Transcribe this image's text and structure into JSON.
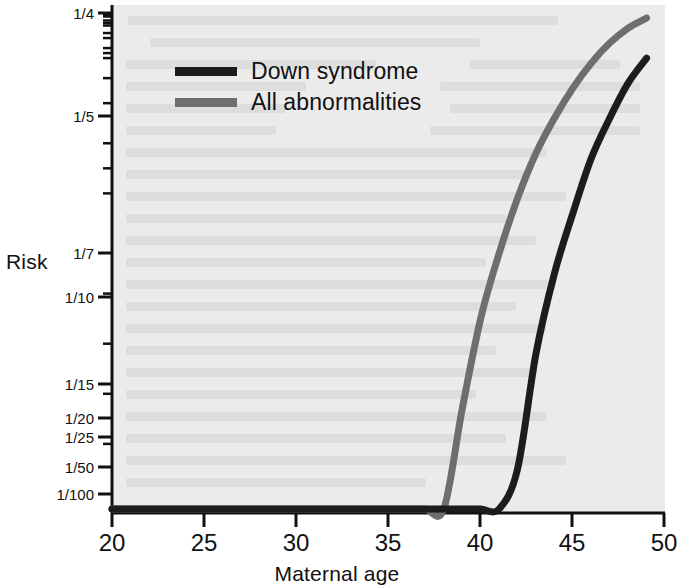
{
  "chart_data": {
    "type": "line",
    "title": "",
    "xlabel": "Maternal age",
    "ylabel": "Risk",
    "xlim": [
      20,
      50
    ],
    "xticks": [
      20,
      25,
      30,
      35,
      40,
      45,
      50
    ],
    "xtick_labels": [
      "20",
      "25",
      "30",
      "35",
      "40",
      "45",
      "50"
    ],
    "y_scale": "reciprocal",
    "ytick_labels": [
      "1/4",
      "1/5",
      "1/7",
      "1/10",
      "1/15",
      "1/20",
      "1/25",
      "1/50",
      "1/100"
    ],
    "ytick_denominators": [
      4,
      5,
      7,
      10,
      15,
      20,
      25,
      50,
      100
    ],
    "ylim_denominators": [
      4,
      130
    ],
    "grid": false,
    "legend_position": "upper left inside",
    "background_color": "#ebebeb",
    "series": [
      {
        "name": "Down syndrome",
        "color": "#1c1c1c",
        "x": [
          20,
          25,
          28,
          30,
          32,
          33,
          34,
          35,
          36,
          37,
          38,
          39,
          40,
          41,
          42,
          43,
          44,
          45,
          46,
          47,
          48,
          49
        ],
        "risk_denominators": [
          1500,
          1350,
          1100,
          900,
          750,
          650,
          560,
          460,
          380,
          300,
          240,
          190,
          150,
          120,
          95,
          72,
          56,
          44,
          33,
          25,
          18,
          13
        ],
        "value_labels": [
          "1/1500",
          "1/1350",
          "1/1100",
          "1/900",
          "1/750",
          "1/650",
          "1/560",
          "1/460",
          "1/380",
          "1/300",
          "1/240",
          "1/190",
          "1/150",
          "1/120",
          "1/95",
          "1/72",
          "1/56",
          "1/44",
          "1/33",
          "1/25",
          "1/18",
          "1/13"
        ]
      },
      {
        "name": "All abnormalities",
        "color": "#6e6e6e",
        "x": [
          20,
          25,
          28,
          30,
          32,
          33,
          34,
          35,
          36,
          37,
          38,
          39,
          40,
          41,
          42,
          43,
          44,
          45,
          46,
          47,
          48,
          49
        ],
        "risk_denominators": [
          530,
          480,
          420,
          380,
          330,
          290,
          250,
          200,
          160,
          130,
          105,
          83,
          65,
          52,
          41,
          32,
          25,
          19,
          14,
          10,
          7,
          5
        ],
        "value_labels": [
          "1/530",
          "1/480",
          "1/420",
          "1/380",
          "1/330",
          "1/290",
          "1/250",
          "1/200",
          "1/160",
          "1/130",
          "1/105",
          "1/83",
          "1/65",
          "1/52",
          "1/41",
          "1/32",
          "1/25",
          "1/19",
          "1/14",
          "1/10",
          "1/7",
          "1/5"
        ]
      }
    ],
    "legend": [
      {
        "label": "Down syndrome",
        "color": "#1c1c1c"
      },
      {
        "label": "All abnormalities",
        "color": "#6e6e6e"
      }
    ]
  },
  "axes": {
    "y_title": "Risk",
    "x_title": "Maternal age",
    "y_ticks": [
      {
        "label": "1/4",
        "y": 13
      },
      {
        "label": "1/5",
        "y": 116
      },
      {
        "label": "1/7",
        "y": 253
      },
      {
        "label": "1/10",
        "y": 297
      },
      {
        "label": "1/15",
        "y": 384
      },
      {
        "label": "1/20",
        "y": 418
      },
      {
        "label": "1/25",
        "y": 437
      },
      {
        "label": "1/50",
        "y": 467
      },
      {
        "label": "1/100",
        "y": 494
      }
    ],
    "x_ticks": [
      {
        "label": "20",
        "x": 112
      },
      {
        "label": "25",
        "x": 204
      },
      {
        "label": "30",
        "x": 296
      },
      {
        "label": "35",
        "x": 388
      },
      {
        "label": "40",
        "x": 480
      },
      {
        "label": "45",
        "x": 572
      },
      {
        "label": "50",
        "x": 664
      }
    ]
  },
  "legend": {
    "down_syndrome_label": "Down syndrome",
    "all_abnormalities_label": "All abnormalities"
  }
}
